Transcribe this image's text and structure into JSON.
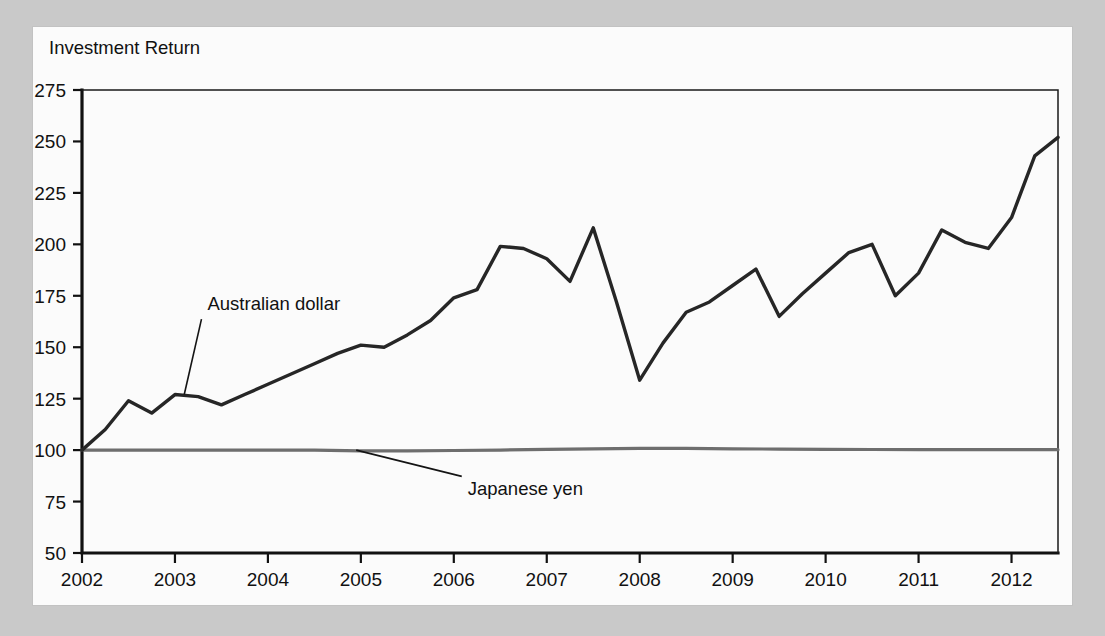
{
  "figure": {
    "background_color": "#c9c9c9",
    "panel_color": "#fbfbfb",
    "y_axis_title": "Investment Return"
  },
  "chart_data": {
    "type": "line",
    "title": "Investment Return",
    "xlabel": "",
    "ylabel": "Investment Return",
    "xlim": [
      2002,
      2012.5
    ],
    "ylim": [
      50,
      275
    ],
    "grid": false,
    "legend": "none (inline annotations)",
    "y_ticks": [
      50,
      75,
      100,
      125,
      150,
      175,
      200,
      225,
      250,
      275
    ],
    "x_ticks": [
      2002,
      2003,
      2004,
      2005,
      2006,
      2007,
      2008,
      2009,
      2010,
      2011,
      2012
    ],
    "annotations": [
      {
        "text": "Australian dollar",
        "series": "Australian dollar",
        "label_x": 2003.35,
        "label_y": 168,
        "point_x": 2003.1,
        "point_y": 127
      },
      {
        "text": "Japanese yen",
        "series": "Japanese yen",
        "label_x": 2006.15,
        "label_y": 78,
        "point_x": 2004.95,
        "point_y": 100
      }
    ],
    "series": [
      {
        "name": "Australian dollar",
        "color": "#262626",
        "x": [
          2002.0,
          2002.25,
          2002.5,
          2002.75,
          2003.0,
          2003.25,
          2003.5,
          2003.75,
          2004.0,
          2004.25,
          2004.5,
          2004.75,
          2005.0,
          2005.25,
          2005.5,
          2005.75,
          2006.0,
          2006.25,
          2006.5,
          2006.75,
          2007.0,
          2007.25,
          2007.5,
          2007.75,
          2008.0,
          2008.25,
          2008.5,
          2008.75,
          2009.0,
          2009.25,
          2009.5,
          2009.75,
          2010.0,
          2010.25,
          2010.5,
          2010.75,
          2011.0,
          2011.25,
          2011.5,
          2011.75,
          2012.0,
          2012.25,
          2012.5
        ],
        "values": [
          100,
          110,
          124,
          118,
          127,
          126,
          122,
          127,
          132,
          137,
          142,
          147,
          151,
          150,
          156,
          163,
          174,
          178,
          199,
          198,
          193,
          182,
          208,
          172,
          134,
          152,
          167,
          172,
          180,
          188,
          165,
          176,
          186,
          196,
          200,
          175,
          186,
          207,
          201,
          198,
          213,
          243,
          252
        ]
      },
      {
        "name": "Japanese yen",
        "color": "#6e6e6e",
        "x": [
          2002.0,
          2002.5,
          2003.0,
          2003.5,
          2004.0,
          2004.5,
          2005.0,
          2005.5,
          2006.0,
          2006.5,
          2007.0,
          2007.5,
          2008.0,
          2008.5,
          2009.0,
          2009.5,
          2010.0,
          2010.5,
          2011.0,
          2011.5,
          2012.0,
          2012.5
        ],
        "values": [
          100,
          100,
          100,
          100,
          100,
          100,
          99.6,
          99.6,
          99.8,
          100,
          100.4,
          100.6,
          100.8,
          100.8,
          100.6,
          100.5,
          100.4,
          100.3,
          100.2,
          100.2,
          100.2,
          100.2
        ]
      }
    ]
  }
}
